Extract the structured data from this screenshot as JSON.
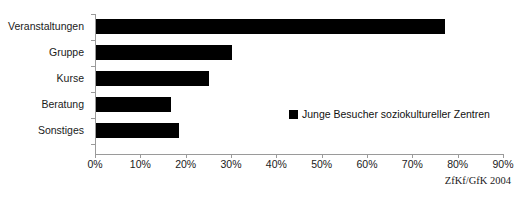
{
  "chart_data": {
    "type": "bar",
    "orientation": "horizontal",
    "title": "",
    "xlabel": "",
    "ylabel": "",
    "categories": [
      "Veranstaltungen",
      "Gruppe",
      "Kurse",
      "Beratung",
      "Sonstiges"
    ],
    "values": [
      77,
      30,
      25,
      16.5,
      18.3
    ],
    "series": [
      {
        "name": "Junge Besucher soziokultureller Zentren",
        "values": [
          77,
          30,
          25,
          16.5,
          18.3
        ],
        "color": "#000000"
      }
    ],
    "xlim": [
      0,
      90
    ],
    "xtick_values": [
      0,
      10,
      20,
      30,
      40,
      50,
      60,
      70,
      80,
      90
    ],
    "xtick_labels": [
      "0%",
      "10%",
      "20%",
      "30%",
      "40%",
      "50%",
      "60%",
      "70%",
      "80%",
      "90%"
    ],
    "grid": false,
    "legend_position": "inside-right",
    "value_suffix": "%"
  },
  "legend": {
    "marker": "filled-square-marker",
    "label": "Junge Besucher soziokultureller Zentren"
  },
  "source_note": "ZfKf/GfK 2004",
  "title_remnant": "",
  "colors": {
    "bar": "#000000",
    "axis": "#9a9a9a",
    "text": "#1a1a1a",
    "background": "#ffffff"
  }
}
